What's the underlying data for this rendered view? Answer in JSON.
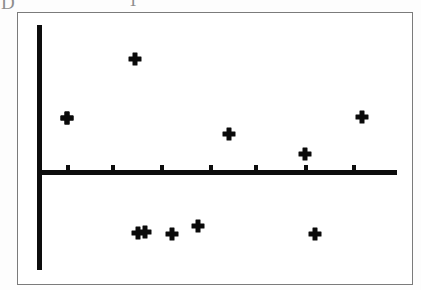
{
  "figure": {
    "background_color": "#ffffff",
    "frame_color": "#7b7b7b",
    "ink_color": "#0d0d0d",
    "scan_artifacts": [
      {
        "name": "artifact-left",
        "text": "D"
      },
      {
        "name": "artifact-mid",
        "text": "T"
      }
    ]
  },
  "chart_data": {
    "type": "scatter",
    "title": "",
    "subtitle": "",
    "xlabel": "",
    "ylabel": "",
    "grid": false,
    "legend": null,
    "legend_position": "none",
    "axis_style": {
      "x_axis": "horizontal zero line with 7 upward tick marks",
      "y_axis": "vertical line at left, no tick marks, no labels",
      "tick_labels_shown": false,
      "axis_labels_shown": false
    },
    "xlim": [
      0,
      8
    ],
    "ylim": [
      -3.4,
      3.4
    ],
    "x_ticks": [
      1,
      2,
      3,
      4,
      5,
      6,
      7
    ],
    "x_tick_labels": [
      "",
      "",
      "",
      "",
      "",
      "",
      ""
    ],
    "y_ticks": [],
    "y_tick_labels": [],
    "marker": "plus",
    "marker_color": "#0a0a0a",
    "n_points": 11,
    "series": [
      {
        "name": "residuals",
        "marker": "plus",
        "points": [
          {
            "x": 0.65,
            "y": 1.3
          },
          {
            "x": 1.8,
            "y": 2.72
          },
          {
            "x": 3.85,
            "y": 0.5
          },
          {
            "x": 4.15,
            "y": -1.5
          },
          {
            "x": 4.75,
            "y": -1.33
          },
          {
            "x": 5.35,
            "y": -1.2
          },
          {
            "x": 1.95,
            "y": -1.63
          },
          {
            "x": 2.1,
            "y": -1.63
          },
          {
            "x": 6.75,
            "y": 0.53
          },
          {
            "x": 7.95,
            "y": 1.36
          },
          {
            "x": 6.0,
            "y": 0.05
          }
        ],
        "x": [
          0.65,
          1.8,
          1.95,
          2.1,
          2.6,
          3.15,
          3.85,
          4.75,
          6.0,
          6.75,
          7.95
        ],
        "y": [
          1.3,
          2.72,
          -1.63,
          -1.63,
          -1.6,
          -1.45,
          0.5,
          0.53,
          0.05,
          -1.63,
          1.36
        ]
      }
    ],
    "points_pixel": [
      {
        "id": "p1",
        "left": 66,
        "top": 117
      },
      {
        "id": "p2",
        "left": 134,
        "top": 58
      },
      {
        "id": "p3",
        "left": 137,
        "top": 232
      },
      {
        "id": "p4",
        "left": 144,
        "top": 231
      },
      {
        "id": "p5",
        "left": 171,
        "top": 233
      },
      {
        "id": "p6",
        "left": 197,
        "top": 225
      },
      {
        "id": "p7",
        "left": 228,
        "top": 133
      },
      {
        "id": "p8",
        "left": 304,
        "top": 153
      },
      {
        "id": "p9",
        "left": 314,
        "top": 233
      },
      {
        "id": "p10",
        "left": 361,
        "top": 116
      },
      {
        "id": "p11",
        "left": 66,
        "top": 117
      }
    ],
    "ticks_pixel": [
      67,
      112,
      161,
      210,
      255,
      305,
      353
    ]
  },
  "geometry": {
    "frame": {
      "left": 17,
      "top": 12,
      "width": 396,
      "height": 273
    },
    "y_axis": {
      "left": 36,
      "top": 24,
      "width": 5,
      "height": 245
    },
    "x_axis": {
      "left": 36,
      "top": 169,
      "width": 360,
      "height": 5
    }
  }
}
